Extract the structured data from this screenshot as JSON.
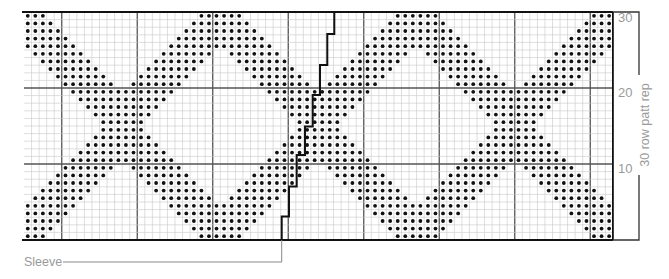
{
  "chart": {
    "columns": 78,
    "rows": 30,
    "origin_x": 24,
    "origin_y": 12,
    "cell_w": 7.55,
    "cell_h": 7.6,
    "major_every": 10,
    "major_col_offset": 5,
    "pattern": {
      "period_cols": 26,
      "rule": "tt=min(t,29-t); if tt<=9: l in [tt-4,tt+2] or [23-tt,29-tt]; else l in [tt-4,29-tt]; l=c mod 26, clipped 0..25"
    },
    "colors": {
      "grid_minor": "#c8c8c8",
      "grid_major": "#555555",
      "border": "#111111",
      "dot": "#111111",
      "label": "#9a9a9a",
      "sleeve_line": "#111111",
      "leader": "#888888"
    }
  },
  "row_labels": [
    {
      "text": "30",
      "row": 30
    },
    {
      "text": "20",
      "row": 20
    },
    {
      "text": "10",
      "row": 10
    }
  ],
  "repeat_label": "30 row patt rep",
  "sleeve_label": "Sleeve",
  "sleeve_steps": [
    [
      334.3,
      12
    ],
    [
      334.3,
      34
    ],
    [
      327.3,
      34
    ],
    [
      327.3,
      65
    ],
    [
      320,
      65
    ],
    [
      320,
      95
    ],
    [
      312.7,
      95
    ],
    [
      312.7,
      126.5
    ],
    [
      305,
      126.5
    ],
    [
      305,
      155
    ],
    [
      296.7,
      155
    ],
    [
      296.7,
      186.5
    ],
    [
      289,
      186.5
    ],
    [
      289,
      216.5
    ],
    [
      281.7,
      216.5
    ],
    [
      281.7,
      240
    ]
  ]
}
